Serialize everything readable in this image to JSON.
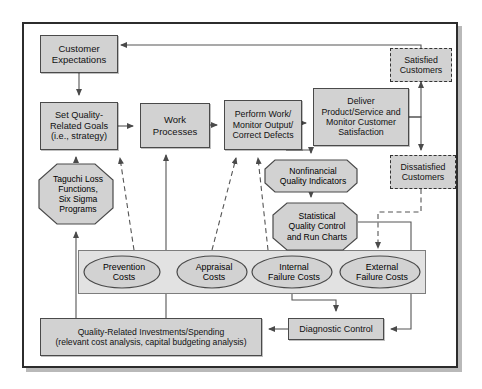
{
  "diagram": {
    "colors": {
      "node_fill": "#d2d2d2",
      "node_stroke": "#4a4a4a",
      "group_fill": "#e2e2e2",
      "group_stroke": "#7d7d7d",
      "frame_stroke": "#2c2c2c",
      "background": "#ffffff",
      "wire": "#555555",
      "dashed_wire": "#555555"
    },
    "nodes": [
      {
        "id": "customer-expectations",
        "shape": "box",
        "label": "Customer\nExpectations",
        "x": 40,
        "y": 35,
        "w": 78,
        "h": 38,
        "font": 9.5
      },
      {
        "id": "set-quality-goals",
        "shape": "box",
        "label": "Set Quality-\nRelated Goals\n(i.e., strategy)",
        "x": 40,
        "y": 102,
        "w": 78,
        "h": 48,
        "font": 9.2
      },
      {
        "id": "taguchi-loss",
        "shape": "octagon",
        "label": "Taguchi Loss\nFunctions,\nSix Sigma\nPrograms",
        "x": 38,
        "y": 163,
        "w": 76,
        "h": 62,
        "font": 8.6
      },
      {
        "id": "work-processes",
        "shape": "box",
        "label": "Work\nProcesses",
        "x": 140,
        "y": 103,
        "w": 70,
        "h": 45,
        "font": 9.5
      },
      {
        "id": "perform-work",
        "shape": "box",
        "label": "Perform Work/\nMonitor Output/\nCorrect Defects",
        "x": 224,
        "y": 100,
        "w": 78,
        "h": 50,
        "font": 8.8
      },
      {
        "id": "deliver-product",
        "shape": "box",
        "label": "Deliver\nProduct/Service and\nMonitor Customer\nSatisfaction",
        "x": 313,
        "y": 88,
        "w": 96,
        "h": 58,
        "font": 8.8
      },
      {
        "id": "satisfied-customers",
        "shape": "dashed",
        "label": "Satisfied\nCustomers",
        "x": 390,
        "y": 48,
        "w": 62,
        "h": 34,
        "font": 8.8
      },
      {
        "id": "dissatisfied-customers",
        "shape": "dashed",
        "label": "Dissatisfied\nCustomers",
        "x": 390,
        "y": 155,
        "w": 66,
        "h": 34,
        "font": 8.8
      },
      {
        "id": "nonfinancial-indicators",
        "shape": "octagon",
        "label": "Nonfinancial\nQuality Indicators",
        "x": 264,
        "y": 159,
        "w": 94,
        "h": 34,
        "font": 8.6
      },
      {
        "id": "statistical-quality-control",
        "shape": "octagon",
        "label": "Statistical\nQuality Control\nand Run Charts",
        "x": 272,
        "y": 202,
        "w": 86,
        "h": 49,
        "font": 8.6
      },
      {
        "id": "prevention-costs",
        "shape": "ellipse",
        "label": "Prevention\nCosts",
        "x": 83,
        "y": 255,
        "w": 78,
        "h": 34,
        "font": 8.8
      },
      {
        "id": "appraisal-costs",
        "shape": "ellipse",
        "label": "Appraisal\nCosts",
        "x": 176,
        "y": 255,
        "w": 72,
        "h": 34,
        "font": 8.8
      },
      {
        "id": "internal-failure-costs",
        "shape": "ellipse",
        "label": "Internal\nFailure Costs",
        "x": 251,
        "y": 255,
        "w": 82,
        "h": 34,
        "font": 8.8
      },
      {
        "id": "external-failure-costs",
        "shape": "ellipse",
        "label": "External\nFailure Costs",
        "x": 339,
        "y": 255,
        "w": 82,
        "h": 34,
        "font": 8.8
      },
      {
        "id": "quality-related-investments",
        "shape": "box",
        "label": "Quality-Related Investments/Spending\n(relevant cost analysis, capital budgeting analysis)",
        "x": 40,
        "y": 318,
        "w": 222,
        "h": 38,
        "font": 8.6
      },
      {
        "id": "diagnostic-control",
        "shape": "box",
        "label": "Diagnostic Control",
        "x": 288,
        "y": 318,
        "w": 96,
        "h": 22,
        "font": 9.0
      }
    ],
    "groups": [
      {
        "id": "cost-of-quality-band",
        "x": 78,
        "y": 250,
        "w": 348,
        "h": 44
      }
    ],
    "edges": [
      {
        "id": "expectations-to-goals",
        "style": "solid"
      },
      {
        "id": "taguchi-to-goals",
        "style": "solid"
      },
      {
        "id": "goals-to-work-processes",
        "style": "solid"
      },
      {
        "id": "work-processes-to-perform-work",
        "style": "solid"
      },
      {
        "id": "perform-work-to-deliver",
        "style": "solid"
      },
      {
        "id": "perform-work-to-nonfinancial",
        "style": "solid"
      },
      {
        "id": "deliver-to-satisfied",
        "style": "solid"
      },
      {
        "id": "deliver-to-dissatisfied",
        "style": "solid"
      },
      {
        "id": "satisfied-to-expectations",
        "style": "solid"
      },
      {
        "id": "nonfinancial-to-statistical",
        "style": "solid"
      },
      {
        "id": "statistical-to-diagnostic",
        "style": "solid"
      },
      {
        "id": "dissatisfied-to-external-failure",
        "style": "dashed"
      },
      {
        "id": "prevention-to-work-processes",
        "style": "dashed"
      },
      {
        "id": "appraisal-to-perform-work",
        "style": "dashed"
      },
      {
        "id": "internal-failure-to-perform-work",
        "style": "dashed"
      },
      {
        "id": "failure-costs-to-diagnostic",
        "style": "solid"
      },
      {
        "id": "diagnostic-to-investments",
        "style": "solid"
      },
      {
        "id": "investments-to-taguchi",
        "style": "solid"
      },
      {
        "id": "investments-to-work-processes",
        "style": "solid"
      }
    ]
  }
}
